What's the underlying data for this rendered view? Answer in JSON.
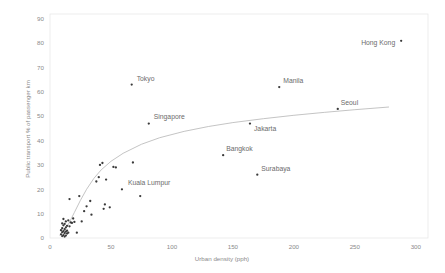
{
  "chart_data": {
    "type": "scatter",
    "title": "",
    "xlabel": "Urban density (pph)",
    "ylabel": "Public transport % of passenger km",
    "xlim": [
      0,
      310
    ],
    "ylim": [
      0,
      92
    ],
    "xticks": [
      0,
      50,
      100,
      150,
      200,
      250,
      300
    ],
    "yticks": [
      0,
      10,
      20,
      30,
      40,
      50,
      60,
      70,
      80,
      90
    ],
    "grid": false,
    "legend": null,
    "marker_color": "#3a3a3a",
    "trendline_color": "#b0b0b0",
    "axis_text_color": "#8a8a8a",
    "label_text_color": "#6b6b6b",
    "labeled_points": [
      {
        "name": "Hong Kong",
        "x": 288,
        "y": 81,
        "label_dx": -40,
        "label_dy": 4
      },
      {
        "name": "Manila",
        "x": 188,
        "y": 62,
        "label_dx": 4,
        "label_dy": -4
      },
      {
        "name": "Seoul",
        "x": 236,
        "y": 53,
        "label_dx": 3,
        "label_dy": -4
      },
      {
        "name": "Tokyo",
        "x": 67,
        "y": 63,
        "label_dx": 5,
        "label_dy": -4
      },
      {
        "name": "Singapore",
        "x": 81,
        "y": 47,
        "label_dx": 5,
        "label_dy": -5
      },
      {
        "name": "Jakarta",
        "x": 164,
        "y": 47,
        "label_dx": 4,
        "label_dy": 7
      },
      {
        "name": "Bangkok",
        "x": 142,
        "y": 34,
        "label_dx": 3,
        "label_dy": -4
      },
      {
        "name": "Surabaya",
        "x": 170,
        "y": 26,
        "label_dx": 4,
        "label_dy": -4
      },
      {
        "name": "Kuala Lumpur",
        "x": 59,
        "y": 20,
        "label_dx": 6,
        "label_dy": -4
      }
    ],
    "unlabeled_points": [
      {
        "x": 9,
        "y": 1.5
      },
      {
        "x": 9,
        "y": 3.2
      },
      {
        "x": 10,
        "y": 0.8
      },
      {
        "x": 10,
        "y": 2.4
      },
      {
        "x": 10,
        "y": 4.0
      },
      {
        "x": 10,
        "y": 6.0
      },
      {
        "x": 11,
        "y": 1.2
      },
      {
        "x": 11,
        "y": 2.8
      },
      {
        "x": 11,
        "y": 5.2
      },
      {
        "x": 11,
        "y": 7.8
      },
      {
        "x": 12,
        "y": 0.6
      },
      {
        "x": 12,
        "y": 2.0
      },
      {
        "x": 12,
        "y": 3.6
      },
      {
        "x": 12,
        "y": 5.8
      },
      {
        "x": 13,
        "y": 1.0
      },
      {
        "x": 13,
        "y": 2.6
      },
      {
        "x": 13,
        "y": 4.4
      },
      {
        "x": 13,
        "y": 6.8
      },
      {
        "x": 14,
        "y": 1.8
      },
      {
        "x": 14,
        "y": 3.0
      },
      {
        "x": 14,
        "y": 5.0
      },
      {
        "x": 15,
        "y": 2.2
      },
      {
        "x": 15,
        "y": 7.2
      },
      {
        "x": 16,
        "y": 4.8
      },
      {
        "x": 16,
        "y": 16.0
      },
      {
        "x": 17,
        "y": 6.4
      },
      {
        "x": 18,
        "y": 6.2
      },
      {
        "x": 19,
        "y": 8.0
      },
      {
        "x": 20,
        "y": 6.6
      },
      {
        "x": 22,
        "y": 2.2
      },
      {
        "x": 24,
        "y": 17.2
      },
      {
        "x": 26,
        "y": 6.8
      },
      {
        "x": 28,
        "y": 11.0
      },
      {
        "x": 30,
        "y": 13.0
      },
      {
        "x": 33,
        "y": 15.2
      },
      {
        "x": 34,
        "y": 9.6
      },
      {
        "x": 38,
        "y": 23.2
      },
      {
        "x": 40,
        "y": 25.0
      },
      {
        "x": 41,
        "y": 30.0
      },
      {
        "x": 43,
        "y": 30.8
      },
      {
        "x": 44,
        "y": 12.0
      },
      {
        "x": 45,
        "y": 13.8
      },
      {
        "x": 46,
        "y": 24.0
      },
      {
        "x": 49,
        "y": 12.6
      },
      {
        "x": 52,
        "y": 29.2
      },
      {
        "x": 54,
        "y": 29.0
      },
      {
        "x": 68,
        "y": 31.0
      },
      {
        "x": 74,
        "y": 17.2
      }
    ],
    "trendline": [
      {
        "x": 8,
        "y": 1.0
      },
      {
        "x": 12,
        "y": 3.0
      },
      {
        "x": 16,
        "y": 6.5
      },
      {
        "x": 20,
        "y": 10.5
      },
      {
        "x": 25,
        "y": 15.5
      },
      {
        "x": 30,
        "y": 20.0
      },
      {
        "x": 36,
        "y": 24.5
      },
      {
        "x": 42,
        "y": 28.0
      },
      {
        "x": 50,
        "y": 31.5
      },
      {
        "x": 60,
        "y": 34.8
      },
      {
        "x": 75,
        "y": 38.5
      },
      {
        "x": 90,
        "y": 41.2
      },
      {
        "x": 110,
        "y": 43.8
      },
      {
        "x": 130,
        "y": 45.8
      },
      {
        "x": 150,
        "y": 47.4
      },
      {
        "x": 175,
        "y": 49.0
      },
      {
        "x": 200,
        "y": 50.4
      },
      {
        "x": 225,
        "y": 51.6
      },
      {
        "x": 250,
        "y": 52.7
      },
      {
        "x": 278,
        "y": 53.8
      }
    ]
  }
}
